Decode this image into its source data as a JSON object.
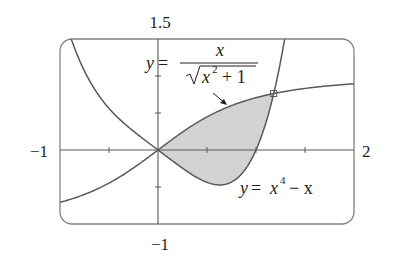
{
  "chart_data": {
    "type": "line",
    "title": "",
    "xlabel": "",
    "ylabel": "",
    "xlim": [
      -1,
      2
    ],
    "ylim": [
      -1,
      1.5
    ],
    "grid": false,
    "axis_labels": {
      "x_min": "−1",
      "x_max": "2",
      "y_max": "1.5",
      "y_min": "−1"
    },
    "x_ticks": [
      -0.5,
      0.5,
      1,
      1.5
    ],
    "y_ticks": [
      -0.5,
      0.5,
      1
    ],
    "series": [
      {
        "name": "y = x/√(x²+1)",
        "function": "x/sqrt(x^2+1)",
        "label_parts": {
          "lhs": "y",
          "eq": "=",
          "numerator": "x",
          "denominator": "x",
          "exp": "2",
          "plus": "+ 1"
        },
        "points": [
          [
            -1,
            -0.707
          ],
          [
            -0.5,
            -0.447
          ],
          [
            0,
            0
          ],
          [
            0.5,
            0.447
          ],
          [
            1,
            0.707
          ],
          [
            1.18,
            0.763
          ],
          [
            1.5,
            0.832
          ],
          [
            2,
            0.894
          ]
        ]
      },
      {
        "name": "y = x⁴ − x",
        "function": "x^4 - x",
        "label_parts": {
          "lhs": "y",
          "eq": "=",
          "base": "x",
          "exp": "4",
          "rest": "− x"
        },
        "points": [
          [
            -1,
            2
          ],
          [
            -0.5,
            0.5625
          ],
          [
            0,
            0
          ],
          [
            0.5,
            -0.4375
          ],
          [
            0.63,
            -0.472
          ],
          [
            1,
            0
          ],
          [
            1.18,
            0.76
          ],
          [
            1.3,
            1.556
          ]
        ]
      }
    ],
    "shaded_region": {
      "between": [
        "x/sqrt(x^2+1)",
        "x^4 - x"
      ],
      "x_from": 0,
      "x_to": 1.18,
      "color": "#d1d2d4"
    },
    "intersection_points": [
      [
        0,
        0
      ],
      [
        1.18,
        0.763
      ]
    ],
    "marked_point": [
      1.18,
      0.763
    ],
    "colors": {
      "curve": "#58595b",
      "axis": "#58595b",
      "frame": "#808285",
      "fill": "#d1d2d4",
      "text": "#231f20"
    }
  }
}
